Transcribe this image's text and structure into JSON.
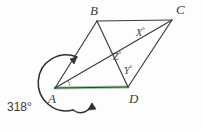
{
  "figure": {
    "kind": "geometry-diagram",
    "background_color": "#fdfdfd",
    "stroke_color": "#3a3a3a",
    "highlight_color": "#9fc6a8",
    "vertices": [
      {
        "id": "A",
        "label": "A",
        "x": 55,
        "y": 88
      },
      {
        "id": "B",
        "label": "B",
        "x": 97,
        "y": 21
      },
      {
        "id": "C",
        "label": "C",
        "x": 172,
        "y": 20
      },
      {
        "id": "D",
        "label": "D",
        "x": 128,
        "y": 87
      }
    ],
    "vertex_label_positions": [
      {
        "id": "A",
        "label": "A",
        "left": 48,
        "top": 92
      },
      {
        "id": "B",
        "label": "B",
        "left": 90,
        "top": 4
      },
      {
        "id": "C",
        "label": "C",
        "left": 176,
        "top": 3
      },
      {
        "id": "D",
        "label": "D",
        "left": 129,
        "top": 92
      }
    ],
    "angle_labels": [
      {
        "id": "X",
        "text": "X",
        "degree_symbol": "°",
        "left": 136,
        "top": 28
      },
      {
        "id": "Z",
        "text": "Z",
        "degree_symbol": "°",
        "left": 113,
        "top": 52
      },
      {
        "id": "Y",
        "text": "Y",
        "degree_symbol": "°",
        "left": 124,
        "top": 66
      }
    ],
    "reflex_angle": {
      "value": "318",
      "degree_symbol": "°",
      "text": "318°",
      "left": 7,
      "top": 101
    },
    "segments": [
      {
        "name": "side-AB",
        "from": "A",
        "to": "B"
      },
      {
        "name": "side-BC",
        "from": "B",
        "to": "C"
      },
      {
        "name": "side-CD",
        "from": "C",
        "to": "D"
      },
      {
        "name": "side-DA",
        "from": "D",
        "to": "A"
      },
      {
        "name": "diagonal-AC",
        "from": "A",
        "to": "C"
      },
      {
        "name": "diagonal-BD",
        "from": "B",
        "to": "D"
      }
    ],
    "arrows": [
      {
        "name": "arrow-to-side-AB",
        "points_at": "side-AB"
      },
      {
        "name": "arrow-to-side-AD",
        "points_at": "side-DA"
      }
    ]
  }
}
